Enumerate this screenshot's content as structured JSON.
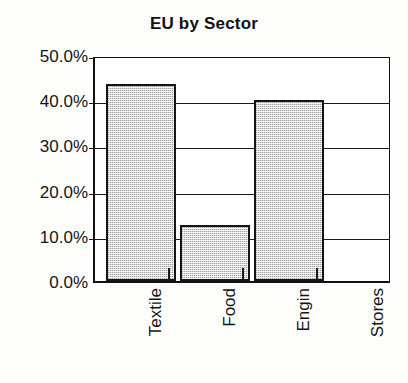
{
  "chart_data": {
    "type": "bar",
    "title": "EU by Sector",
    "xlabel": "",
    "ylabel": "",
    "categories": [
      "Textile",
      "Food",
      "Engin",
      "Stores"
    ],
    "values": [
      43.6,
      12.4,
      40.0,
      0.0
    ],
    "ylim": [
      0,
      50
    ],
    "ytick_values": [
      50,
      40,
      30,
      20,
      10,
      0
    ],
    "ytick_labels": [
      "50.0%",
      "40.0%",
      "30.0%",
      "20.0%",
      "10.0%",
      "0.0%"
    ],
    "grid": true,
    "legend": false,
    "bar_fill_color": "#d6d6d6",
    "bar_edge_color": "#151515",
    "axis_color": "#111111",
    "value_format": "percent",
    "xtick_label_rotation": 90
  },
  "figure": {
    "background_color": "#fdfdfc"
  }
}
